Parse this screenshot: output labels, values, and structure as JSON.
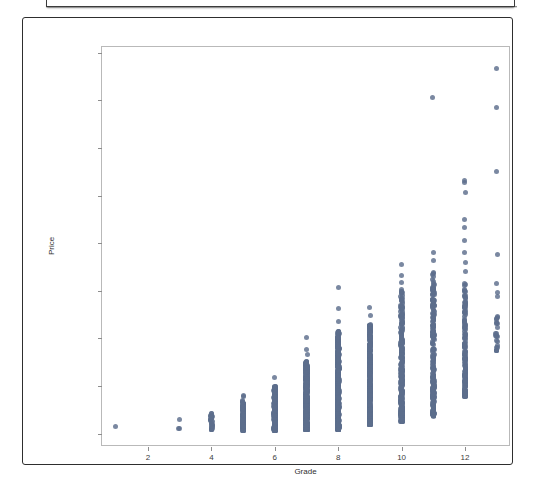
{
  "window": {
    "top_panel_present": true
  },
  "figure": {
    "background_color": "#ffffff",
    "frame_color": "#2e2e2e"
  },
  "chart_data": {
    "type": "scatter",
    "title": "",
    "xlabel": "Grade",
    "ylabel": "Price",
    "xlim": [
      0.55,
      13.45
    ],
    "ylim": [
      -280000,
      8120000
    ],
    "grid": false,
    "legend": null,
    "marker_color": "#5d6e8c",
    "marker_size_px": 5,
    "xticks": [
      2,
      4,
      6,
      8,
      10,
      12
    ],
    "xtick_labels": [
      "2",
      "4",
      "6",
      "8",
      "10",
      "12"
    ],
    "yticks": [
      0,
      1000000,
      2000000,
      3000000,
      4000000,
      5000000,
      6000000,
      7000000,
      8000000
    ],
    "ytick_labels": [
      "0",
      "1000000",
      "2000000",
      "3000000",
      "4000000",
      "5000000",
      "6000000",
      "7000000",
      "8000000"
    ],
    "series": [
      {
        "name": "House sales",
        "x_label": "Grade",
        "y_label": "Price",
        "columns": [
          {
            "grade": 1,
            "n_visible": 1,
            "y_min": 142000,
            "y_max": 142000,
            "y_dense_max": 142000,
            "outliers": []
          },
          {
            "grade": 3,
            "n_visible": 2,
            "y_min": 100000,
            "y_max": 290000,
            "y_dense_max": 110000,
            "outliers": [
              290000
            ]
          },
          {
            "grade": 4,
            "n_visible": 30,
            "y_min": 80000,
            "y_max": 480000,
            "y_dense_max": 430000,
            "outliers": []
          },
          {
            "grade": 5,
            "n_visible": 110,
            "y_min": 60000,
            "y_max": 800000,
            "y_dense_max": 700000,
            "outliers": [
              780000,
              800000
            ]
          },
          {
            "grade": 6,
            "n_visible": 260,
            "y_min": 70000,
            "y_max": 1170000,
            "y_dense_max": 1010000,
            "outliers": [
              1170000
            ]
          },
          {
            "grade": 7,
            "n_visible": 520,
            "y_min": 80000,
            "y_max": 2030000,
            "y_dense_max": 1510000,
            "outliers": [
              1660000,
              1760000,
              2030000
            ]
          },
          {
            "grade": 8,
            "n_visible": 520,
            "y_min": 90000,
            "y_max": 3060000,
            "y_dense_max": 2150000,
            "outliers": [
              2350000,
              2620000,
              3060000
            ]
          },
          {
            "grade": 9,
            "n_visible": 360,
            "y_min": 190000,
            "y_max": 2650000,
            "y_dense_max": 2290000,
            "outliers": [
              2480000,
              2650000
            ]
          },
          {
            "grade": 10,
            "n_visible": 300,
            "y_min": 250000,
            "y_max": 3550000,
            "y_dense_max": 3020000,
            "outliers": [
              3180000,
              3320000,
              3550000
            ]
          },
          {
            "grade": 11,
            "n_visible": 250,
            "y_min": 370000,
            "y_max": 7050000,
            "y_dense_max": 3390000,
            "outliers": [
              3640000,
              3810000,
              7050000
            ]
          },
          {
            "grade": 12,
            "n_visible": 150,
            "y_min": 780000,
            "y_max": 5310000,
            "y_dense_max": 3240000,
            "outliers": [
              3410000,
              3600000,
              3800000,
              4060000,
              4320000,
              4500000,
              5060000,
              5270000,
              5310000
            ]
          },
          {
            "grade": 13,
            "n_visible": 22,
            "y_min": 1720000,
            "y_max": 7670000,
            "y_dense_max": 2480000,
            "outliers": [
              2890000,
              2960000,
              3160000,
              3760000,
              5510000,
              6840000,
              7670000
            ]
          }
        ]
      }
    ]
  },
  "axes": {
    "x_axis_label": "Grade",
    "y_axis_label": "Price"
  }
}
